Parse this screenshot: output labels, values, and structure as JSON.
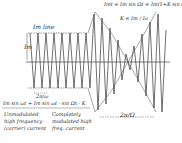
{
  "figure": {
    "type": "amplitude-modulation-waveform",
    "labels": {
      "im_line": "Im line",
      "im_marker": "Im",
      "modulated_formula": "Imt = Im sin Ωt = Im(1+K sin Ωt)",
      "k_formula": "K = Im / Io",
      "carrier_period": "2π/ω",
      "modulation_period": "2π/Ω",
      "bottom_formula": "Im sin ωt + Im sin ωt · sin Ωt · K",
      "left_caption": [
        "Unmodulated",
        "high frequency",
        "(carrier) current"
      ],
      "right_caption": [
        "Completely",
        "modulated high",
        "freq. current"
      ]
    },
    "colors": {
      "ink": "#2a2a2a",
      "background": "#ffffff"
    }
  }
}
